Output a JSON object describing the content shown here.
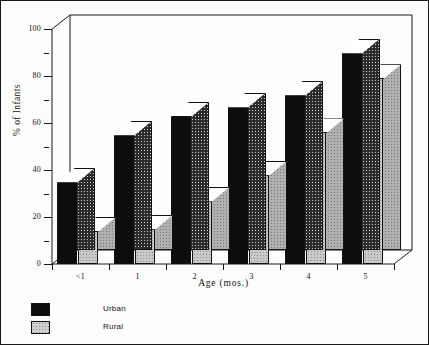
{
  "chart_data": {
    "type": "bar",
    "title": "",
    "xlabel": "Age  (mos.)",
    "ylabel": "% of Infants",
    "categories": [
      "<1",
      "1",
      "2",
      "3",
      "4",
      "5"
    ],
    "series": [
      {
        "name": "Urban",
        "values": [
          35,
          55,
          63,
          67,
          72,
          90
        ],
        "color": "#0d0d0d"
      },
      {
        "name": "Rural",
        "values": [
          14,
          15,
          27,
          38,
          56,
          79
        ],
        "color": "#c9c9c9"
      }
    ],
    "ylim": [
      0,
      100
    ],
    "ytick_labels": [
      "0",
      "20",
      "40",
      "60",
      "80",
      "100"
    ],
    "ytick_values": [
      0,
      20,
      40,
      60,
      80,
      100
    ],
    "yminor_values": [
      10,
      30,
      50,
      70,
      90
    ],
    "grid": false,
    "legend_position": "below-left",
    "style": "3d-bar"
  },
  "legend": {
    "items": [
      {
        "label": "Urban",
        "swatch": "urban"
      },
      {
        "label": "Rural",
        "swatch": "rural"
      }
    ]
  }
}
